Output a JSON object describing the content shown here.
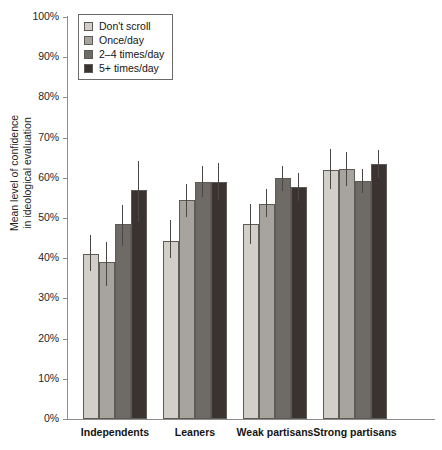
{
  "chart_data": {
    "type": "bar",
    "title": "",
    "xlabel": "",
    "ylabel": "Mean level of confidence in ideological evaluation",
    "ylabel_lines": [
      "Mean level of confidence",
      "in ideological evaluation"
    ],
    "ylim": [
      0,
      100
    ],
    "y_unit": "%",
    "grid": false,
    "legend_position": "top-left",
    "y_ticks": [
      {
        "value": 100,
        "label": "100%"
      },
      {
        "value": 90,
        "label": "90%"
      },
      {
        "value": 80,
        "label": "80%"
      },
      {
        "value": 70,
        "label": "70%"
      },
      {
        "value": 60,
        "label": "60%"
      },
      {
        "value": 50,
        "label": "50%"
      },
      {
        "value": 40,
        "label": "40%"
      },
      {
        "value": 30,
        "label": "30%"
      },
      {
        "value": 20,
        "label": "20%"
      },
      {
        "value": 10,
        "label": "10%"
      },
      {
        "value": 0,
        "label": "0%"
      }
    ],
    "categories": [
      "Independents",
      "Leaners",
      "Weak partisans",
      "Strong partisans"
    ],
    "series": [
      {
        "name": "Don't scroll",
        "color": "#d2cfc9",
        "values": [
          41.0,
          44.2,
          48.4,
          62.0
        ],
        "err_low": [
          36.8,
          40.0,
          43.6,
          57.2
        ],
        "err_high": [
          45.8,
          49.4,
          53.4,
          67.2
        ]
      },
      {
        "name": "Once/day",
        "color": "#a7a49e",
        "values": [
          39.0,
          54.5,
          53.6,
          62.1
        ],
        "err_low": [
          33.0,
          50.2,
          50.2,
          58.0
        ],
        "err_high": [
          44.0,
          58.4,
          57.2,
          66.4
        ]
      },
      {
        "name": "2–4 times/day",
        "color": "#6e6a66",
        "values": [
          48.6,
          59.0,
          59.9,
          59.1
        ],
        "err_low": [
          43.0,
          55.2,
          56.8,
          56.2
        ],
        "err_high": [
          53.2,
          63.0,
          63.0,
          62.2
        ]
      },
      {
        "name": "5+ times/day",
        "color": "#3b3331",
        "values": [
          57.0,
          59.0,
          57.6,
          63.4
        ],
        "err_low": [
          49.0,
          54.4,
          54.2,
          60.0
        ],
        "err_high": [
          64.2,
          63.6,
          61.2,
          67.0
        ]
      }
    ]
  }
}
